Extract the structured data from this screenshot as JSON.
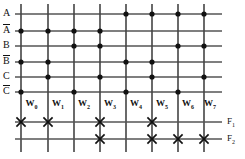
{
  "diagram": {
    "kind": "programmable-logic-array",
    "colors": {
      "line": "#555555",
      "wordline": "#444444",
      "dot": "#111111",
      "cross": "#111111",
      "background": "#ffffff"
    },
    "geometry": {
      "left_line_x": 15,
      "right_line_x": 222,
      "top_line_y": 4,
      "bottom_line_y": 152,
      "column_x": [
        21,
        48,
        74,
        100,
        126,
        152,
        178,
        204
      ],
      "input_row_y": [
        14,
        31,
        46,
        62,
        77,
        92
      ],
      "output_row_y": [
        122,
        139
      ],
      "label_row_y": 104
    },
    "input_rows": [
      {
        "label": "A",
        "overbar": false,
        "dots_at_columns": [
          4,
          5,
          6,
          7
        ]
      },
      {
        "label": "A",
        "overbar": true,
        "dots_at_columns": [
          0,
          1,
          2,
          3
        ]
      },
      {
        "label": "B",
        "overbar": false,
        "dots_at_columns": [
          2,
          3,
          6,
          7
        ]
      },
      {
        "label": "B",
        "overbar": true,
        "dots_at_columns": [
          0,
          1,
          4,
          5
        ]
      },
      {
        "label": "C",
        "overbar": false,
        "dots_at_columns": [
          1,
          3,
          5,
          7
        ]
      },
      {
        "label": "C",
        "overbar": true,
        "dots_at_columns": [
          0,
          2,
          4,
          6
        ]
      }
    ],
    "word_lines": [
      {
        "label": "W",
        "index": "0"
      },
      {
        "label": "W",
        "index": "1"
      },
      {
        "label": "W",
        "index": "2"
      },
      {
        "label": "W",
        "index": "3"
      },
      {
        "label": "W",
        "index": "4"
      },
      {
        "label": "W",
        "index": "5"
      },
      {
        "label": "W",
        "index": "6"
      },
      {
        "label": "W",
        "index": "7"
      }
    ],
    "output_rows": [
      {
        "label": "F",
        "index": "1",
        "crosses_at_columns": [
          0,
          1,
          3,
          5
        ]
      },
      {
        "label": "F",
        "index": "2",
        "crosses_at_columns": [
          3,
          5,
          6,
          7
        ]
      }
    ]
  }
}
